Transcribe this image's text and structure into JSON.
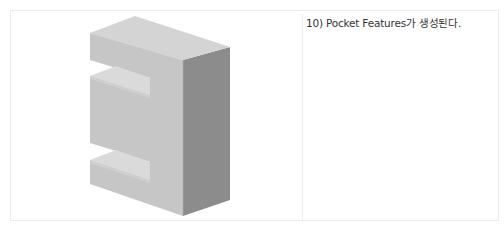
{
  "step": {
    "caption": "10) Pocket Features가 생성된다."
  },
  "figure": {
    "colors": {
      "top": "#d6d6d6",
      "front": "#c4c4c4",
      "side": "#8a8a8a",
      "pocket_floor": "#dcdcdc"
    }
  }
}
